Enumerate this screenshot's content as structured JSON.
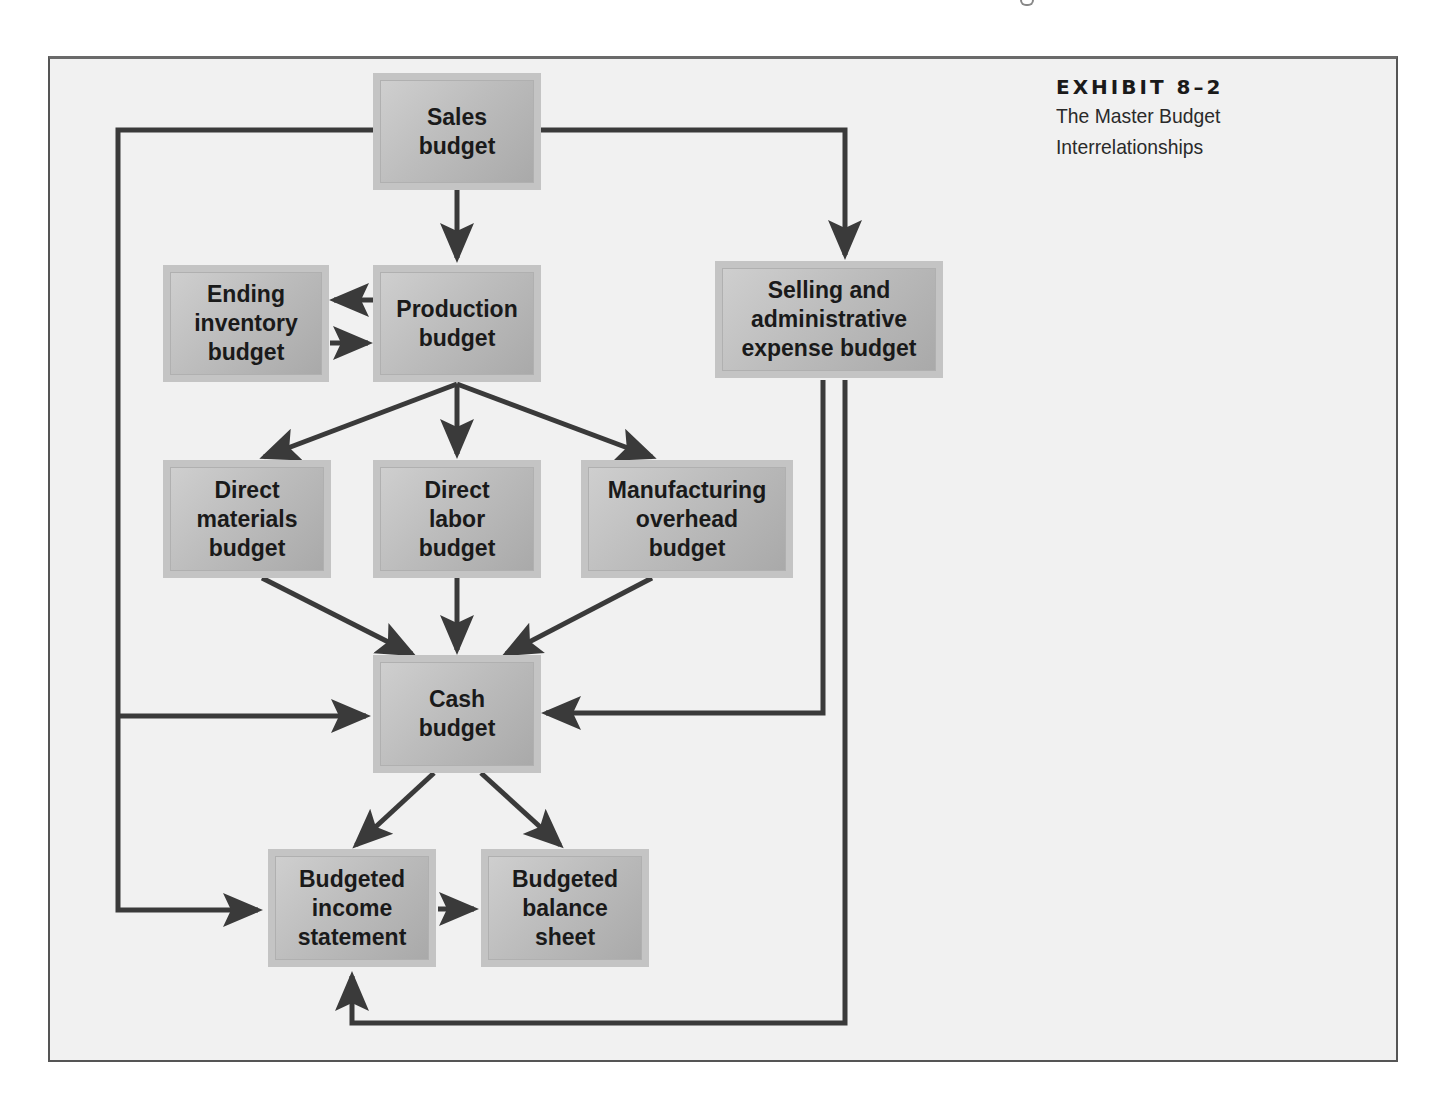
{
  "exhibit": {
    "number": "EXHIBIT 8–2",
    "title": "The Master Budget\nInterrelationships"
  },
  "colors": {
    "background": "#f1f1f1",
    "box_fill": "#bdbdbd",
    "box_border": "#c4c4c4",
    "arrow": "#3a3a3a",
    "text": "#1a1a1a"
  },
  "nodes": {
    "sales": "Sales\nbudget",
    "ending_inventory": "Ending\ninventory\nbudget",
    "production": "Production\nbudget",
    "selling_admin": "Selling and\nadministrative\nexpense budget",
    "direct_materials": "Direct\nmaterials\nbudget",
    "direct_labor": "Direct\nlabor\nbudget",
    "manufacturing_overhead": "Manufacturing\noverhead\nbudget",
    "cash": "Cash\nbudget",
    "income_statement": "Budgeted\nincome\nstatement",
    "balance_sheet": "Budgeted\nbalance\nsheet"
  },
  "edges": [
    {
      "from": "Sales budget",
      "to": "Production budget"
    },
    {
      "from": "Sales budget",
      "to": "Selling and administrative expense budget"
    },
    {
      "from": "Sales budget",
      "to": "Cash budget"
    },
    {
      "from": "Sales budget",
      "to": "Budgeted income statement"
    },
    {
      "from": "Production budget",
      "to": "Ending inventory budget"
    },
    {
      "from": "Ending inventory budget",
      "to": "Production budget"
    },
    {
      "from": "Production budget",
      "to": "Direct materials budget"
    },
    {
      "from": "Production budget",
      "to": "Direct labor budget"
    },
    {
      "from": "Production budget",
      "to": "Manufacturing overhead budget"
    },
    {
      "from": "Direct materials budget",
      "to": "Cash budget"
    },
    {
      "from": "Direct labor budget",
      "to": "Cash budget"
    },
    {
      "from": "Manufacturing overhead budget",
      "to": "Cash budget"
    },
    {
      "from": "Selling and administrative expense budget",
      "to": "Cash budget"
    },
    {
      "from": "Selling and administrative expense budget",
      "to": "Budgeted income statement"
    },
    {
      "from": "Cash budget",
      "to": "Budgeted income statement"
    },
    {
      "from": "Cash budget",
      "to": "Budgeted balance sheet"
    },
    {
      "from": "Budgeted income statement",
      "to": "Budgeted balance sheet"
    }
  ]
}
